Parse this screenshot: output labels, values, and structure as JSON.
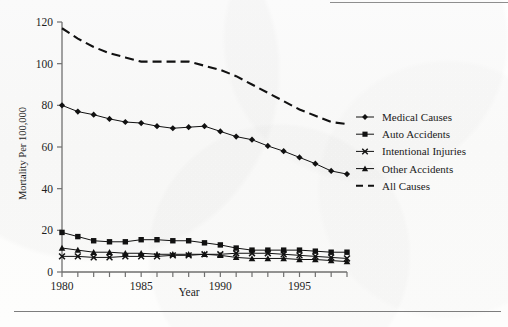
{
  "figure": {
    "kind": "scanned-line-chart",
    "ink_color": "#111111",
    "axis_color": "#7c7c7c",
    "paper_color": "#fdfdfd"
  },
  "axes": {
    "y_label": "Mortality Per 100,000",
    "x_label": "Year",
    "y_ticks": [
      "0",
      "20",
      "40",
      "60",
      "80",
      "100",
      "120"
    ],
    "x_ticks_labeled": [
      "1980",
      "1985",
      "1990",
      "1995"
    ]
  },
  "legend": {
    "position": "right-middle",
    "entries": [
      {
        "label": "Medical Causes",
        "marker": "diamond-marker",
        "line": "solid"
      },
      {
        "label": "Auto Accidents",
        "marker": "square-marker",
        "line": "solid"
      },
      {
        "label": "Intentional Injuries",
        "marker": "cross-marker",
        "line": "solid"
      },
      {
        "label": "Other Accidents",
        "marker": "triangle-marker",
        "line": "solid"
      },
      {
        "label": "All Causes",
        "marker": "none",
        "line": "dashed"
      }
    ]
  },
  "chart_data": {
    "type": "line",
    "title": "",
    "xlabel": "Year",
    "ylabel": "Mortality Per 100,000",
    "xlim": [
      1980,
      1998
    ],
    "ylim": [
      0,
      120
    ],
    "ytick_step": 20,
    "grid": false,
    "legend_position": "right",
    "x": [
      1980,
      1981,
      1982,
      1983,
      1984,
      1985,
      1986,
      1987,
      1988,
      1989,
      1990,
      1991,
      1992,
      1993,
      1994,
      1995,
      1996,
      1997,
      1998
    ],
    "series": [
      {
        "name": "All Causes",
        "marker": "none",
        "line": "dashed",
        "values": [
          117,
          112,
          108,
          105,
          103,
          101,
          101,
          101,
          101,
          99,
          97,
          94,
          90,
          86,
          82,
          78,
          75,
          72,
          71
        ]
      },
      {
        "name": "Medical Causes",
        "marker": "diamond",
        "line": "solid",
        "values": [
          80,
          77,
          75.5,
          73.5,
          72,
          71.5,
          70,
          69,
          69.5,
          70,
          67.5,
          65,
          63.5,
          60.5,
          58,
          55,
          52,
          48.5,
          47
        ]
      },
      {
        "name": "Auto Accidents",
        "marker": "square",
        "line": "solid",
        "values": [
          19,
          17,
          15,
          14.5,
          14.5,
          15.5,
          15.5,
          15,
          15,
          14,
          13,
          11.5,
          10.5,
          10.5,
          10.5,
          10.5,
          10,
          9.5,
          9.5
        ]
      },
      {
        "name": "Other Accidents",
        "marker": "triangle",
        "line": "solid",
        "values": [
          11.5,
          10.5,
          9.5,
          9.5,
          9,
          9,
          8.5,
          8.5,
          8.5,
          8.5,
          8,
          7,
          6.5,
          6.5,
          6.5,
          6,
          6,
          5.5,
          5
        ]
      },
      {
        "name": "Intentional Injuries",
        "marker": "cross",
        "line": "solid",
        "values": [
          7.5,
          7.5,
          7,
          7,
          7.5,
          7.5,
          7.5,
          8,
          8,
          8.5,
          8.5,
          9,
          9,
          9,
          8.5,
          8,
          7.5,
          7,
          6.5
        ]
      }
    ]
  }
}
